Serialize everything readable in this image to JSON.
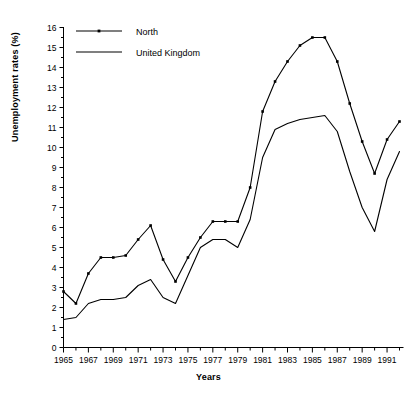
{
  "chart_data": {
    "type": "line",
    "title": "",
    "xlabel": "Years",
    "ylabel": "Unemployment rates (%)",
    "xlim": [
      1965,
      1992
    ],
    "ylim": [
      0,
      16
    ],
    "grid": false,
    "legend_position": "top-left",
    "y_ticks": [
      0,
      1,
      2,
      3,
      4,
      5,
      6,
      7,
      8,
      9,
      10,
      11,
      12,
      13,
      14,
      15,
      16
    ],
    "y_tick_labels": [
      "0",
      "1",
      "2",
      "3",
      "4",
      "5",
      "6",
      "7",
      "8",
      "9",
      "10",
      "11",
      "12",
      "13",
      "14",
      "15",
      "16"
    ],
    "x_ticks": [
      1965,
      1966,
      1967,
      1968,
      1969,
      1970,
      1971,
      1972,
      1973,
      1974,
      1975,
      1976,
      1977,
      1978,
      1979,
      1980,
      1981,
      1982,
      1983,
      1984,
      1985,
      1986,
      1987,
      1988,
      1989,
      1990,
      1991,
      1992
    ],
    "x_tick_labels": [
      "1965",
      "",
      "1967",
      "",
      "1969",
      "",
      "1971",
      "",
      "1973",
      "",
      "1975",
      "",
      "1977",
      "",
      "1979",
      "",
      "1981",
      "",
      "1983",
      "",
      "1985",
      "",
      "1987",
      "",
      "1989",
      "",
      "1991",
      ""
    ],
    "x": [
      1965,
      1966,
      1967,
      1968,
      1969,
      1970,
      1971,
      1972,
      1973,
      1974,
      1975,
      1976,
      1977,
      1978,
      1979,
      1980,
      1981,
      1982,
      1983,
      1984,
      1985,
      1986,
      1987,
      1988,
      1989,
      1990,
      1991,
      1992
    ],
    "series": [
      {
        "name": "North",
        "marker": "square",
        "color": "#000000",
        "values": [
          2.8,
          2.2,
          3.7,
          4.5,
          4.5,
          4.6,
          5.4,
          6.1,
          4.4,
          3.3,
          4.5,
          5.5,
          6.3,
          6.3,
          6.3,
          8.0,
          11.8,
          13.3,
          14.3,
          15.1,
          15.5,
          15.5,
          14.3,
          12.2,
          10.3,
          8.7,
          10.4,
          11.3
        ]
      },
      {
        "name": "United Kingdom",
        "marker": "none",
        "color": "#000000",
        "values": [
          1.4,
          1.5,
          2.2,
          2.4,
          2.4,
          2.5,
          3.1,
          3.4,
          2.5,
          2.2,
          3.6,
          5.0,
          5.4,
          5.4,
          5.0,
          6.4,
          9.5,
          10.9,
          11.2,
          11.4,
          11.5,
          11.6,
          10.8,
          8.8,
          7.0,
          5.8,
          8.4,
          9.8
        ]
      }
    ]
  },
  "legend": {
    "items": [
      {
        "label": "North"
      },
      {
        "label": "United Kingdom"
      }
    ]
  }
}
